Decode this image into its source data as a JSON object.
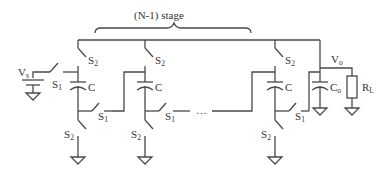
{
  "diagram": {
    "type": "circuit-schematic",
    "title_brace_label": "(N-1) stage",
    "source_label": "V",
    "source_sub": "s",
    "output_label": "V",
    "output_sub": "o",
    "load_label": "R",
    "load_sub": "L",
    "output_cap_label": "C",
    "output_cap_sub": "o",
    "stage_cap_label": "C",
    "switch1_label": "S",
    "switch1_sub": "1",
    "switch2_label": "S",
    "switch2_sub": "2",
    "ellipsis": "…",
    "stroke_color": "#4a4a4a",
    "stages": [
      {
        "name": "stage-1",
        "cap": "C",
        "switches": [
          "S1 (input)",
          "S1",
          "S2 (top)",
          "S2 (bottom)"
        ]
      },
      {
        "name": "stage-2",
        "cap": "C",
        "switches": [
          "S1",
          "S2 (top)",
          "S2 (bottom)"
        ]
      },
      {
        "name": "stage-n-1",
        "cap": "C",
        "switches": [
          "S1",
          "S2 (top)",
          "S2 (bottom)"
        ]
      }
    ]
  }
}
